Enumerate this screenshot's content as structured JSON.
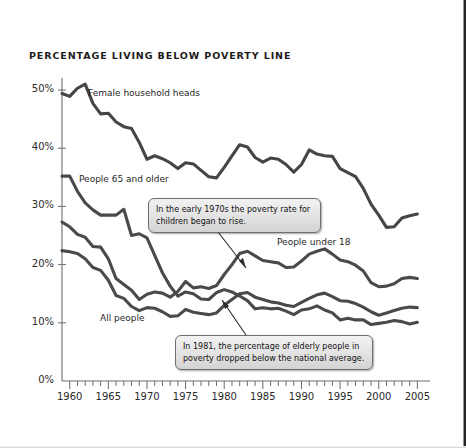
{
  "chart_data": {
    "type": "line",
    "title": "PERCENTAGE LIVING BELOW POVERTY LINE",
    "xlabel": "",
    "ylabel": "",
    "xlim": [
      1959,
      2005
    ],
    "ylim": [
      0,
      50
    ],
    "grid": false,
    "legend_position": "inline-labels",
    "ytick_labels": [
      "0%",
      "10%",
      "20%",
      "30%",
      "40%",
      "50%"
    ],
    "ytick_values": [
      0,
      10,
      20,
      30,
      40,
      50
    ],
    "xtick_labels": [
      "1960",
      "1965",
      "1970",
      "1975",
      "1980",
      "1985",
      "1990",
      "1995",
      "2000",
      "2005"
    ],
    "xtick_values": [
      1960,
      1965,
      1970,
      1975,
      1980,
      1985,
      1990,
      1995,
      2000,
      2005
    ],
    "x": [
      1959,
      1960,
      1961,
      1962,
      1963,
      1964,
      1965,
      1966,
      1967,
      1968,
      1969,
      1970,
      1971,
      1972,
      1973,
      1974,
      1975,
      1976,
      1977,
      1978,
      1979,
      1980,
      1981,
      1982,
      1983,
      1984,
      1985,
      1986,
      1987,
      1988,
      1989,
      1990,
      1991,
      1992,
      1993,
      1994,
      1995,
      1996,
      1997,
      1998,
      1999,
      2000,
      2001,
      2002,
      2003,
      2004,
      2005
    ],
    "series": [
      {
        "name": "Female household heads",
        "color": "#454545",
        "values": [
          49.4,
          48.9,
          50.3,
          51.0,
          47.7,
          45.9,
          46.0,
          44.5,
          43.7,
          43.4,
          41.0,
          38.1,
          38.7,
          38.2,
          37.5,
          36.5,
          37.5,
          37.3,
          36.2,
          35.1,
          34.9,
          36.7,
          38.7,
          40.6,
          40.2,
          38.4,
          37.6,
          38.3,
          38.1,
          37.2,
          35.9,
          37.2,
          39.7,
          39.0,
          38.7,
          38.6,
          36.5,
          35.8,
          35.1,
          33.1,
          30.4,
          28.5,
          26.4,
          26.5,
          28.0,
          28.4,
          28.7
        ]
      },
      {
        "name": "People 65 and older",
        "color": "#4a4a4a",
        "values": [
          35.2,
          35.2,
          32.6,
          30.6,
          29.4,
          28.5,
          28.5,
          28.5,
          29.5,
          25.0,
          25.3,
          24.6,
          21.6,
          18.6,
          16.3,
          14.6,
          15.3,
          15.0,
          14.1,
          14.0,
          15.2,
          15.7,
          15.3,
          14.6,
          13.8,
          12.4,
          12.6,
          12.4,
          12.5,
          12.0,
          11.4,
          12.2,
          12.4,
          12.9,
          12.2,
          11.7,
          10.5,
          10.8,
          10.5,
          10.5,
          9.7,
          9.9,
          10.1,
          10.4,
          10.2,
          9.8,
          10.1
        ]
      },
      {
        "name": "People under 18",
        "color": "#4a4a4a",
        "values": [
          27.3,
          26.5,
          25.2,
          24.7,
          23.1,
          23.0,
          21.0,
          17.6,
          16.6,
          15.6,
          14.0,
          14.9,
          15.3,
          15.1,
          14.4,
          15.4,
          17.1,
          16.0,
          16.2,
          15.9,
          16.4,
          18.3,
          20.0,
          21.9,
          22.3,
          21.5,
          20.7,
          20.5,
          20.3,
          19.5,
          19.6,
          20.6,
          21.8,
          22.3,
          22.7,
          21.8,
          20.8,
          20.5,
          19.9,
          18.9,
          16.9,
          16.2,
          16.3,
          16.7,
          17.6,
          17.8,
          17.6
        ]
      },
      {
        "name": "All people",
        "color": "#4a4a4a",
        "values": [
          22.4,
          22.2,
          21.9,
          21.0,
          19.5,
          19.0,
          17.3,
          14.7,
          14.2,
          12.8,
          12.1,
          12.6,
          12.5,
          11.9,
          11.1,
          11.2,
          12.3,
          11.8,
          11.6,
          11.4,
          11.7,
          13.0,
          14.0,
          15.0,
          15.2,
          14.4,
          14.0,
          13.6,
          13.4,
          13.0,
          12.8,
          13.5,
          14.2,
          14.8,
          15.1,
          14.5,
          13.8,
          13.7,
          13.3,
          12.7,
          11.9,
          11.3,
          11.7,
          12.1,
          12.5,
          12.7,
          12.6
        ]
      }
    ],
    "annotations": [
      {
        "id": "callout-children",
        "text": "In the early 1970s the poverty rate for children began to rise.",
        "target_x": 1975,
        "target_y": 17
      },
      {
        "id": "callout-elderly",
        "text": "In 1981, the percentage of elderly people in poverty dropped below the national average.",
        "target_x": 1982,
        "target_y": 15
      }
    ]
  }
}
